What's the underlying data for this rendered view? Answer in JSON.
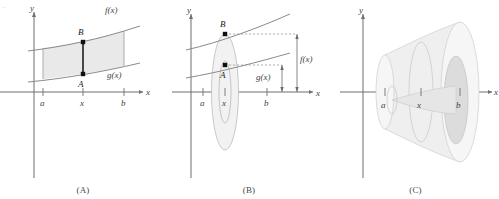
{
  "figure": {
    "panels": [
      {
        "id": "A",
        "caption": "(A)",
        "axis_x_label": "x",
        "axis_y_label": "y",
        "ticks": [
          "a",
          "x",
          "b"
        ],
        "curve_upper_label": "f(x)",
        "curve_lower_label": "g(x)",
        "point_upper": "B",
        "point_lower": "A",
        "region_fill": "#e9e9e9",
        "description": "Region between curves f(x) and g(x) from a to b with vertical segment AB at x"
      },
      {
        "id": "B",
        "caption": "(B)",
        "axis_x_label": "x",
        "axis_y_label": "y",
        "ticks": [
          "a",
          "x",
          "b"
        ],
        "point_upper": "B",
        "point_lower": "A",
        "dimension_outer": "f(x)",
        "dimension_inner": "g(x)",
        "description": "Segment AB revolved about the x-axis generating a washer with outer radius f(x) and inner radius g(x)"
      },
      {
        "id": "C",
        "caption": "(C)",
        "axis_x_label": "x",
        "axis_y_label": "y",
        "ticks": [
          "a",
          "x",
          "b"
        ],
        "description": "The full solid of revolution swept from a to b, hollow core visible at the right face"
      }
    ],
    "colors": {
      "curve": "#8a8a8a",
      "axis": "#6f6f6f",
      "band": "#e9e9e9",
      "segment": "#1d1d1d",
      "solid": "#efefef"
    }
  }
}
